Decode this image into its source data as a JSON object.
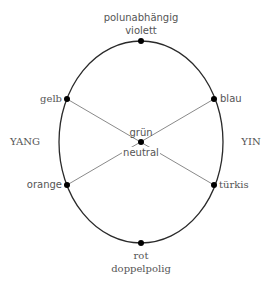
{
  "diagram": {
    "colors": {
      "ellipse": "#2a2a2a",
      "cross_lines": "#8a8a8a",
      "dots": "#000000",
      "text": "#555555"
    },
    "top": {
      "line1": "polunabhängig",
      "line2": "violett"
    },
    "bottom": {
      "line1": "rot",
      "line2": "doppelpolig"
    },
    "upper_left": "gelb",
    "upper_right": "blau",
    "lower_left": "orange",
    "lower_right": "türkis",
    "center_top": "grün",
    "center_bottom": "neutral",
    "side_left": "YANG",
    "side_right": "YIN"
  }
}
